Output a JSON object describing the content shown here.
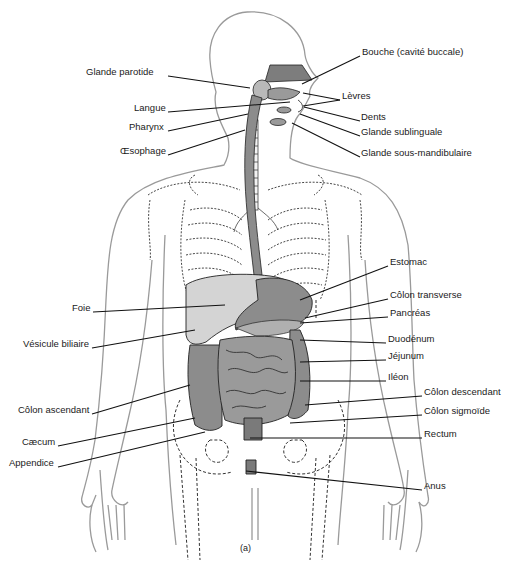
{
  "figure": {
    "caption": "(a)",
    "colors": {
      "outline": "#9a9a9a",
      "organ_fill": "#8c8c8c",
      "organ_dark": "#6e6e6e",
      "liver_fill": "#d4d4d4",
      "line": "#111111",
      "text": "#1a1a1a"
    }
  },
  "labels_left": [
    {
      "text": "Glande parotide",
      "x": 86,
      "y": 71,
      "lx1": 168,
      "ly1": 76,
      "lx2": 250,
      "ly2": 88
    },
    {
      "text": "Langue",
      "x": 134,
      "y": 107,
      "lx1": 168,
      "ly1": 112,
      "lx2": 290,
      "ly2": 102
    },
    {
      "text": "Pharynx",
      "x": 129,
      "y": 126,
      "lx1": 168,
      "ly1": 131,
      "lx2": 248,
      "ly2": 114
    },
    {
      "text": "Œsophage",
      "x": 120,
      "y": 150,
      "lx1": 168,
      "ly1": 155,
      "lx2": 245,
      "ly2": 130
    },
    {
      "text": "Foie",
      "x": 72,
      "y": 307,
      "lx1": 93,
      "ly1": 312,
      "lx2": 225,
      "ly2": 305
    },
    {
      "text": "Vésicule biliaire",
      "x": 23,
      "y": 343,
      "lx1": 92,
      "ly1": 348,
      "lx2": 195,
      "ly2": 330
    },
    {
      "text": "Côlon ascendant",
      "x": 18,
      "y": 409,
      "lx1": 92,
      "ly1": 414,
      "lx2": 190,
      "ly2": 385
    },
    {
      "text": "Cæcum",
      "x": 22,
      "y": 441,
      "lx1": 58,
      "ly1": 446,
      "lx2": 195,
      "ly2": 418
    },
    {
      "text": "Appendice",
      "x": 9,
      "y": 462,
      "lx1": 58,
      "ly1": 467,
      "lx2": 205,
      "ly2": 432
    }
  ],
  "labels_right": [
    {
      "text": "Bouche (cavité buccale)",
      "x": 362,
      "y": 51,
      "lx1": 360,
      "ly1": 56,
      "lx2": 302,
      "ly2": 84
    },
    {
      "text": "Lèvres",
      "x": 342,
      "y": 95,
      "lx1": 340,
      "ly1": 100,
      "lx2": 303,
      "ly2": 93,
      "lx3": 303,
      "ly3": 106
    },
    {
      "text": "Dents",
      "x": 361,
      "y": 116,
      "lx1": 360,
      "ly1": 121,
      "lx2": 304,
      "ly2": 107
    },
    {
      "text": "Glande sublinguale",
      "x": 361,
      "y": 131,
      "lx1": 360,
      "ly1": 136,
      "lx2": 300,
      "ly2": 114
    },
    {
      "text": "Glande sous-mandibulaire",
      "x": 361,
      "y": 152,
      "lx1": 360,
      "ly1": 157,
      "lx2": 292,
      "ly2": 123
    },
    {
      "text": "Estomac",
      "x": 390,
      "y": 261,
      "lx1": 388,
      "ly1": 266,
      "lx2": 300,
      "ly2": 300
    },
    {
      "text": "Côlon transverse",
      "x": 390,
      "y": 294,
      "lx1": 388,
      "ly1": 299,
      "lx2": 305,
      "ly2": 318
    },
    {
      "text": "Pancréas",
      "x": 390,
      "y": 312,
      "lx1": 388,
      "ly1": 317,
      "lx2": 300,
      "ly2": 323
    },
    {
      "text": "Duodénum",
      "x": 388,
      "y": 338,
      "lx1": 386,
      "ly1": 343,
      "lx2": 300,
      "ly2": 340
    },
    {
      "text": "Jéjunum",
      "x": 388,
      "y": 355,
      "lx1": 386,
      "ly1": 360,
      "lx2": 300,
      "ly2": 362
    },
    {
      "text": "Iléon",
      "x": 388,
      "y": 376,
      "lx1": 386,
      "ly1": 381,
      "lx2": 300,
      "ly2": 381
    },
    {
      "text": "Côlon descendant",
      "x": 424,
      "y": 391,
      "lx1": 422,
      "ly1": 396,
      "lx2": 305,
      "ly2": 405
    },
    {
      "text": "Côlon sigmoïde",
      "x": 424,
      "y": 410,
      "lx1": 422,
      "ly1": 415,
      "lx2": 290,
      "ly2": 423
    },
    {
      "text": "Rectum",
      "x": 424,
      "y": 433,
      "lx1": 422,
      "ly1": 438,
      "lx2": 250,
      "ly2": 438
    },
    {
      "text": "Anus",
      "x": 424,
      "y": 485,
      "lx1": 422,
      "ly1": 490,
      "lx2": 246,
      "ly2": 471
    }
  ]
}
